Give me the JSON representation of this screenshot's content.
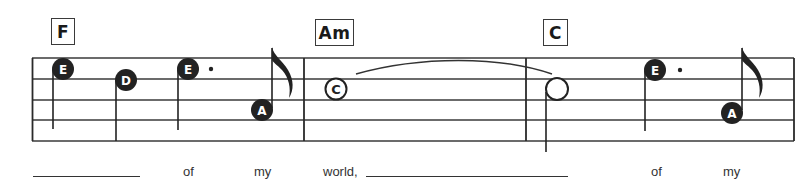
{
  "chords": [
    {
      "label": "F",
      "measure": 1
    },
    {
      "label": "Am",
      "measure": 2
    },
    {
      "label": "C",
      "measure": 3
    }
  ],
  "notes": [
    {
      "name": "E",
      "style": "filled",
      "duration": "quarter",
      "measure": 1
    },
    {
      "name": "D",
      "style": "filled",
      "duration": "quarter",
      "measure": 1
    },
    {
      "name": "E",
      "style": "filled",
      "duration": "dotted-quarter",
      "measure": 1
    },
    {
      "name": "A",
      "style": "filled",
      "duration": "eighth",
      "measure": 1
    },
    {
      "name": "C",
      "style": "hollow",
      "duration": "whole",
      "measure": 2,
      "tied": true
    },
    {
      "name": "",
      "style": "hollow",
      "duration": "half",
      "measure": 3,
      "tied_from_previous": true
    },
    {
      "name": "E",
      "style": "filled",
      "duration": "dotted-quarter",
      "measure": 3
    },
    {
      "name": "A",
      "style": "filled",
      "duration": "eighth",
      "measure": 3
    }
  ],
  "lyrics": [
    {
      "type": "blank"
    },
    {
      "type": "word",
      "text": "of"
    },
    {
      "type": "word",
      "text": "my"
    },
    {
      "type": "word",
      "text": "world,"
    },
    {
      "type": "blank"
    },
    {
      "type": "word",
      "text": "of"
    },
    {
      "type": "word",
      "text": "my"
    }
  ],
  "colors": {
    "ink": "#222222",
    "staff": "#3a3a3a",
    "paper": "#ffffff"
  }
}
